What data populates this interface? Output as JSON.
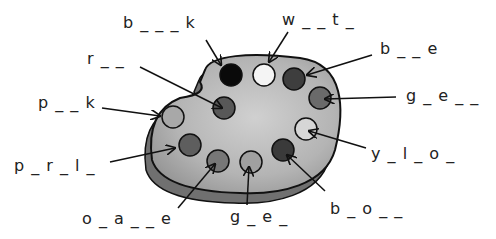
{
  "worksheet": {
    "palette": {
      "board_color": "#b8b8b8",
      "shadow_color": "#7a7a7a",
      "outline_color": "#111111"
    },
    "paints": [
      {
        "name": "black",
        "cx": 231,
        "cy": 75,
        "r": 11,
        "fill": "#0a0a0a"
      },
      {
        "name": "white",
        "cx": 264,
        "cy": 75,
        "r": 11,
        "fill": "#f4f4f4"
      },
      {
        "name": "blue",
        "cx": 294,
        "cy": 79,
        "r": 11,
        "fill": "#3e3e3e"
      },
      {
        "name": "green",
        "cx": 320,
        "cy": 98,
        "r": 11,
        "fill": "#6a6a6a"
      },
      {
        "name": "red",
        "cx": 224,
        "cy": 108,
        "r": 11,
        "fill": "#585858"
      },
      {
        "name": "pink",
        "cx": 173,
        "cy": 117,
        "r": 11,
        "fill": "#a8a8a8"
      },
      {
        "name": "yellow",
        "cx": 306,
        "cy": 129,
        "r": 11,
        "fill": "#d6d6d6"
      },
      {
        "name": "purple",
        "cx": 190,
        "cy": 145,
        "r": 11,
        "fill": "#5e5e5e"
      },
      {
        "name": "orange",
        "cx": 218,
        "cy": 161,
        "r": 11,
        "fill": "#777777"
      },
      {
        "name": "grey",
        "cx": 251,
        "cy": 162,
        "r": 11,
        "fill": "#a0a0a0"
      },
      {
        "name": "brown",
        "cx": 283,
        "cy": 150,
        "r": 11,
        "fill": "#3a3a3a"
      }
    ],
    "labels": [
      {
        "id": "black",
        "text": "b _ _ _ k",
        "x": 123,
        "y": 14,
        "ax1": 206,
        "ay1": 40,
        "ax2": 221,
        "ay2": 65
      },
      {
        "id": "white",
        "text": "w _ _ t _",
        "x": 282,
        "y": 11,
        "ax1": 288,
        "ay1": 32,
        "ax2": 269,
        "ay2": 62
      },
      {
        "id": "blue",
        "text": "b _ _ e",
        "x": 380,
        "y": 40,
        "ax1": 372,
        "ay1": 55,
        "ax2": 307,
        "ay2": 75
      },
      {
        "id": "green",
        "text": "g _ e _ _",
        "x": 406,
        "y": 87,
        "ax1": 396,
        "ay1": 97,
        "ax2": 325,
        "ay2": 99
      },
      {
        "id": "red",
        "text": "r _ _",
        "x": 87,
        "y": 50,
        "ax1": 140,
        "ay1": 67,
        "ax2": 222,
        "ay2": 108
      },
      {
        "id": "pink",
        "text": "p _ _ k",
        "x": 38,
        "y": 94,
        "ax1": 102,
        "ay1": 108,
        "ax2": 160,
        "ay2": 116
      },
      {
        "id": "yellow",
        "text": "y _ l _ o _",
        "x": 371,
        "y": 145,
        "ax1": 366,
        "ay1": 148,
        "ax2": 309,
        "ay2": 131
      },
      {
        "id": "purple",
        "text": "p _ r _ l _",
        "x": 14,
        "y": 157,
        "ax1": 110,
        "ay1": 162,
        "ax2": 175,
        "ay2": 148
      },
      {
        "id": "orange",
        "text": "o _ a _ _ e",
        "x": 82,
        "y": 210,
        "ax1": 178,
        "ay1": 208,
        "ax2": 215,
        "ay2": 164
      },
      {
        "id": "grey",
        "text": "g _ e _",
        "x": 230,
        "y": 208,
        "ax1": 247,
        "ay1": 205,
        "ax2": 249,
        "ay2": 167
      },
      {
        "id": "brown",
        "text": "b _ o _ _",
        "x": 330,
        "y": 200,
        "ax1": 325,
        "ay1": 191,
        "ax2": 287,
        "ay2": 155
      }
    ]
  }
}
